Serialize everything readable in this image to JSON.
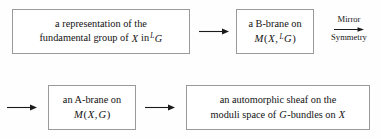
{
  "diagram": {
    "background_color": "#fefefe",
    "border_color": "#9a9a9a",
    "text_color": "#121212",
    "boxes": [
      {
        "id": "representation",
        "line1": "a representation of the",
        "line2_pre": "fundamental group of",
        "line2_var": "X",
        "line2_mid": "in",
        "line2_sup": "L",
        "line2_group": "G"
      },
      {
        "id": "b-brane",
        "line1": "a B-brane on",
        "m": "M",
        "open": "(",
        "x": "X",
        "comma": ",",
        "sup": "L",
        "g": "G",
        "close": ")"
      },
      {
        "id": "a-brane",
        "line1": "an A-brane on",
        "m": "M",
        "open": "(",
        "x": "X",
        "comma": ",",
        "g": "G",
        "close": ")"
      },
      {
        "id": "automorphic-sheaf",
        "line1": "an automorphic sheaf on the",
        "line2_pre": "moduli space of",
        "line2_g": "G",
        "line2_mid": "-bundles on",
        "line2_x": "X"
      }
    ],
    "arrows": [
      {
        "id": "arrow-rep-to-bbrane",
        "label": ""
      },
      {
        "id": "arrow-lead-to-abrane",
        "label": ""
      },
      {
        "id": "arrow-abrane-to-sheaf",
        "label": ""
      }
    ],
    "mirror_symmetry": {
      "word_top": "Mirror",
      "word_bottom": "Symmetry"
    }
  }
}
